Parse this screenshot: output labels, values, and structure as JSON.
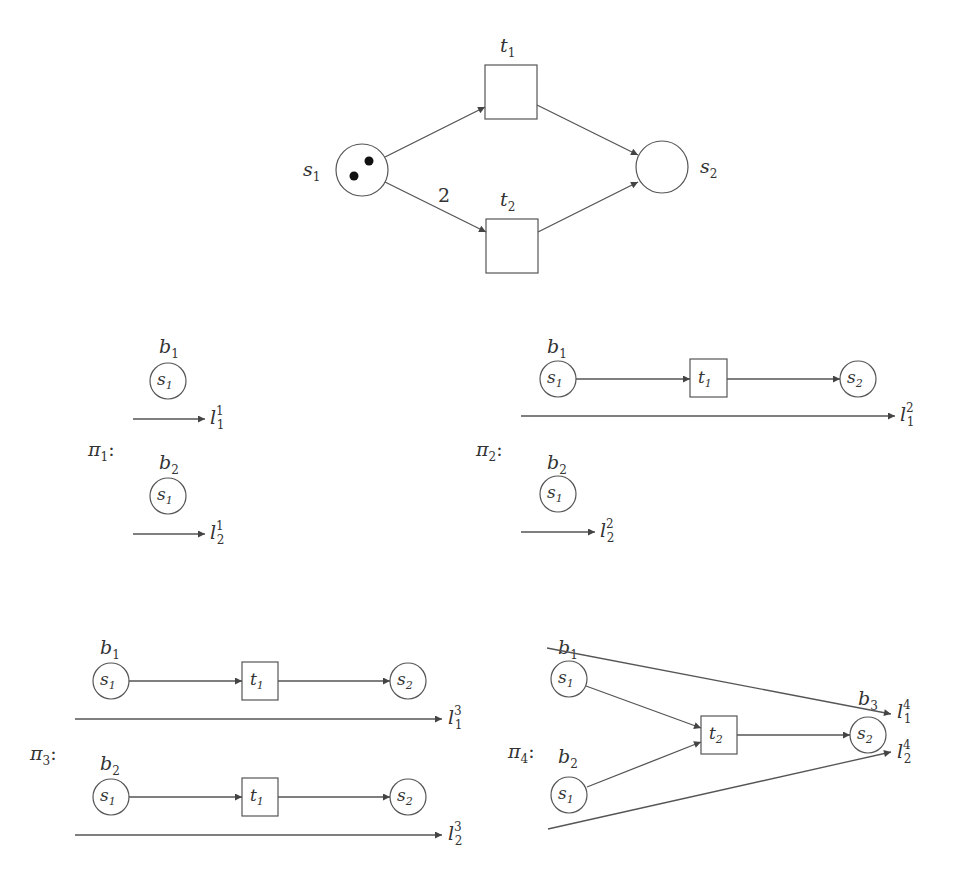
{
  "net": {
    "places": [
      {
        "id": "s1",
        "name": "s",
        "sub": "1",
        "tokens": 2
      },
      {
        "id": "s2",
        "name": "s",
        "sub": "2",
        "tokens": 0
      }
    ],
    "transitions": [
      {
        "id": "t1",
        "name": "t",
        "sub": "1"
      },
      {
        "id": "t2",
        "name": "t",
        "sub": "2"
      }
    ],
    "arc_weight_s1_t2": "2"
  },
  "processes": [
    {
      "name": "π",
      "sub": "1",
      "colon": ":",
      "conditions": [
        {
          "name": "b",
          "sub": "1",
          "place": "s",
          "place_sub": "1"
        },
        {
          "name": "b",
          "sub": "2",
          "place": "s",
          "place_sub": "1"
        }
      ],
      "lines": [
        {
          "name": "l",
          "sub": "1",
          "sup": "1"
        },
        {
          "name": "l",
          "sub": "2",
          "sup": "1"
        }
      ]
    },
    {
      "name": "π",
      "sub": "2",
      "colon": ":",
      "conditions": [
        {
          "name": "b",
          "sub": "1",
          "place": "s",
          "place_sub": "1",
          "event": "t",
          "event_sub": "1",
          "out": "s",
          "out_sub": "2"
        },
        {
          "name": "b",
          "sub": "2",
          "place": "s",
          "place_sub": "1"
        }
      ],
      "lines": [
        {
          "name": "l",
          "sub": "1",
          "sup": "2"
        },
        {
          "name": "l",
          "sub": "2",
          "sup": "2"
        }
      ]
    },
    {
      "name": "π",
      "sub": "3",
      "colon": ":",
      "conditions": [
        {
          "name": "b",
          "sub": "1",
          "place": "s",
          "place_sub": "1",
          "event": "t",
          "event_sub": "1",
          "out": "s",
          "out_sub": "2"
        },
        {
          "name": "b",
          "sub": "2",
          "place": "s",
          "place_sub": "1",
          "event": "t",
          "event_sub": "1",
          "out": "s",
          "out_sub": "2"
        }
      ],
      "lines": [
        {
          "name": "l",
          "sub": "1",
          "sup": "3"
        },
        {
          "name": "l",
          "sub": "2",
          "sup": "3"
        }
      ]
    },
    {
      "name": "π",
      "sub": "4",
      "colon": ":",
      "conditions": [
        {
          "name": "b",
          "sub": "1",
          "place": "s",
          "place_sub": "1"
        },
        {
          "name": "b",
          "sub": "2",
          "place": "s",
          "place_sub": "1"
        },
        {
          "name": "b",
          "sub": "3",
          "place": "s",
          "place_sub": "2"
        }
      ],
      "event": {
        "name": "t",
        "sub": "2"
      },
      "lines": [
        {
          "name": "l",
          "sub": "1",
          "sup": "4"
        },
        {
          "name": "l",
          "sub": "2",
          "sup": "4"
        }
      ]
    }
  ]
}
